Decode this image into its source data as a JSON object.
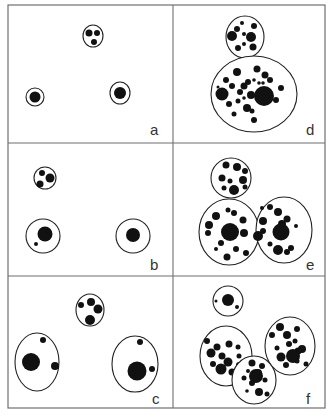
{
  "figure": {
    "background": "#ffffff",
    "ink_color": "#111111",
    "frame": {
      "x": 8,
      "y": 5,
      "width": 317,
      "height": 403
    },
    "grid": {
      "vertical_x": 173,
      "horizontal_y": [
        143,
        276
      ]
    },
    "panels": [
      {
        "id": "a",
        "label": "a",
        "label_pos": [
          150,
          135
        ],
        "cells": [
          {
            "cx": 93,
            "cy": 36,
            "rx": 10,
            "ry": 11,
            "dots": [
              [
                89,
                33,
                3.5
              ],
              [
                97,
                33,
                3
              ],
              [
                94,
                42,
                3
              ]
            ]
          },
          {
            "cx": 35,
            "cy": 97,
            "rx": 9,
            "ry": 9,
            "ring": true,
            "dots": [
              [
                35,
                97,
                5.5
              ]
            ]
          },
          {
            "cx": 120,
            "cy": 93,
            "rx": 10,
            "ry": 11,
            "ring": true,
            "dots": [
              [
                120,
                93,
                6
              ]
            ]
          }
        ]
      },
      {
        "id": "b",
        "label": "b",
        "label_pos": [
          150,
          270
        ],
        "cells": [
          {
            "cx": 45,
            "cy": 178,
            "rx": 11,
            "ry": 11,
            "dots": [
              [
                42,
                173,
                3
              ],
              [
                50,
                178,
                4.5
              ],
              [
                40,
                184,
                3.5
              ]
            ]
          },
          {
            "cx": 43,
            "cy": 236,
            "rx": 17,
            "ry": 17,
            "dots": [
              [
                45,
                234,
                7.5
              ],
              [
                36,
                244,
                2
              ]
            ]
          },
          {
            "cx": 133,
            "cy": 236,
            "rx": 17,
            "ry": 17,
            "dots": [
              [
                133,
                235,
                7
              ]
            ]
          }
        ]
      },
      {
        "id": "c",
        "label": "c",
        "label_pos": [
          152,
          404
        ],
        "cells": [
          {
            "cx": 90,
            "cy": 310,
            "rx": 14,
            "ry": 16,
            "dots": [
              [
                81,
                305,
                3
              ],
              [
                91,
                302,
                4
              ],
              [
                98,
                309,
                4.5
              ],
              [
                90,
                320,
                5
              ]
            ]
          },
          {
            "cx": 37,
            "cy": 362,
            "rx": 22,
            "ry": 29,
            "dots": [
              [
                31,
                362,
                9
              ],
              [
                43,
                340,
                3
              ],
              [
                55,
                366,
                4
              ]
            ]
          },
          {
            "cx": 135,
            "cy": 364,
            "rx": 23,
            "ry": 28,
            "dots": [
              [
                137,
                371,
                9.5
              ],
              [
                140,
                342,
                3
              ],
              [
                152,
                369,
                3
              ]
            ]
          }
        ]
      },
      {
        "id": "d",
        "label": "d",
        "label_pos": [
          306,
          135
        ],
        "cells": [
          {
            "cx": 245,
            "cy": 37,
            "rx": 19,
            "ry": 21,
            "dots": [
              [
                242,
                23,
                2
              ],
              [
                254,
                26,
                3
              ],
              [
                237,
                29,
                3
              ],
              [
                244,
                34,
                2
              ],
              [
                232,
                36,
                5
              ],
              [
                251,
                37,
                5
              ],
              [
                244,
                44,
                2
              ],
              [
                253,
                47,
                3.5
              ],
              [
                238,
                48,
                3
              ]
            ]
          },
          {
            "cx": 254,
            "cy": 94,
            "rx": 43,
            "ry": 38,
            "dots": [
              [
                237,
                72,
                4
              ],
              [
                257,
                69,
                3.5
              ],
              [
                265,
                75,
                3.5
              ],
              [
                226,
                80,
                3
              ],
              [
                270,
                80,
                3
              ],
              [
                248,
                82,
                3
              ],
              [
                254,
                80,
                1.8
              ],
              [
                259,
                83,
                1.8
              ],
              [
                263,
                83,
                1.8
              ],
              [
                232,
                86,
                3
              ],
              [
                244,
                86,
                3.5
              ],
              [
                218,
                87,
                1.5
              ],
              [
                240,
                92,
                3
              ],
              [
                281,
                88,
                3
              ],
              [
                222,
                94,
                6.5
              ],
              [
                244,
                98,
                1.8
              ],
              [
                251,
                95,
                4
              ],
              [
                264,
                96,
                10
              ],
              [
                238,
                101,
                2.5
              ],
              [
                276,
                100,
                3
              ],
              [
                229,
                104,
                3
              ],
              [
                247,
                108,
                4
              ],
              [
                234,
                114,
                2.5
              ],
              [
                252,
                111,
                2.5
              ],
              [
                254,
                120,
                3
              ]
            ]
          }
        ]
      },
      {
        "id": "e",
        "label": "e",
        "label_pos": [
          306,
          270
        ],
        "cells": [
          {
            "cx": 231,
            "cy": 178,
            "rx": 20,
            "ry": 20,
            "dots": [
              [
                226,
                165,
                3.5
              ],
              [
                237,
                167,
                4
              ],
              [
                245,
                171,
                3
              ],
              [
                222,
                178,
                3.5
              ],
              [
                230,
                181,
                2.5
              ],
              [
                243,
                180,
                4
              ],
              [
                245,
                187,
                2.5
              ],
              [
                224,
                188,
                2.5
              ],
              [
                234,
                190,
                5
              ]
            ]
          },
          {
            "cx": 229,
            "cy": 232,
            "rx": 30,
            "ry": 33,
            "dots": [
              [
                228,
                210,
                2.5
              ],
              [
                234,
                213,
                3
              ],
              [
                216,
                216,
                4
              ],
              [
                243,
                220,
                3.5
              ],
              [
                209,
                225,
                4
              ],
              [
                244,
                233,
                4
              ],
              [
                208,
                233,
                3
              ],
              [
                230,
                232,
                9
              ],
              [
                221,
                243,
                3
              ],
              [
                216,
                249,
                2
              ],
              [
                236,
                249,
                3
              ],
              [
                246,
                253,
                3
              ],
              [
                227,
                257,
                3.5
              ]
            ]
          },
          {
            "cx": 284,
            "cy": 230,
            "rx": 28,
            "ry": 33,
            "dots": [
              [
                262,
                208,
                2
              ],
              [
                270,
                207,
                3
              ],
              [
                278,
                212,
                4
              ],
              [
                287,
                219,
                3.5
              ],
              [
                263,
                221,
                4
              ],
              [
                282,
                224,
                4
              ],
              [
                296,
                226,
                2
              ],
              [
                263,
                231,
                3
              ],
              [
                281,
                232,
                8.5
              ],
              [
                258,
                236,
                5
              ],
              [
                270,
                244,
                2.5
              ],
              [
                278,
                250,
                5
              ],
              [
                287,
                252,
                3
              ],
              [
                291,
                248,
                3
              ]
            ]
          }
        ]
      },
      {
        "id": "f",
        "label": "f",
        "label_pos": [
          306,
          404
        ],
        "cells": [
          {
            "cx": 228,
            "cy": 301,
            "rx": 15,
            "ry": 15,
            "dots": [
              [
                228,
                300,
                6
              ],
              [
                216,
                301,
                1.5
              ],
              [
                237,
                307,
                2
              ]
            ]
          },
          {
            "cx": 226,
            "cy": 356,
            "rx": 26,
            "ry": 30,
            "dots": [
              [
                207,
                341,
                3
              ],
              [
                217,
                347,
                3.5
              ],
              [
                229,
                344,
                3.5
              ],
              [
                238,
                347,
                2.5
              ],
              [
                211,
                353,
                4.5
              ],
              [
                222,
                356,
                3.5
              ],
              [
                239,
                356,
                2.5
              ],
              [
                228,
                362,
                4.5
              ],
              [
                213,
                364,
                3
              ],
              [
                239,
                365,
                3
              ],
              [
                221,
                369,
                5.5
              ],
              [
                232,
                372,
                3.5
              ]
            ]
          },
          {
            "cx": 254,
            "cy": 380,
            "rx": 22,
            "ry": 24,
            "dots": [
              [
                252,
                363,
                3.5
              ],
              [
                262,
                366,
                3
              ],
              [
                248,
                371,
                2
              ],
              [
                258,
                373,
                4
              ],
              [
                256,
                376,
                7
              ],
              [
                244,
                378,
                2.5
              ],
              [
                252,
                383,
                3
              ],
              [
                265,
                380,
                2.5
              ],
              [
                247,
                391,
                1.8
              ],
              [
                259,
                392,
                4
              ],
              [
                267,
                394,
                2.5
              ]
            ]
          },
          {
            "cx": 290,
            "cy": 346,
            "rx": 25,
            "ry": 29,
            "dots": [
              [
                280,
                327,
                4
              ],
              [
                297,
                329,
                3
              ],
              [
                272,
                335,
                3
              ],
              [
                287,
                335,
                4
              ],
              [
                295,
                341,
                2.5
              ],
              [
                289,
                344,
                3
              ],
              [
                302,
                349,
                4
              ],
              [
                277,
                348,
                2.5
              ],
              [
                298,
                351,
                3.5
              ],
              [
                293,
                356,
                7
              ],
              [
                281,
                357,
                4.5
              ],
              [
                297,
                361,
                2.5
              ],
              [
                306,
                364,
                2.5
              ],
              [
                286,
                365,
                3
              ]
            ]
          }
        ]
      }
    ]
  }
}
